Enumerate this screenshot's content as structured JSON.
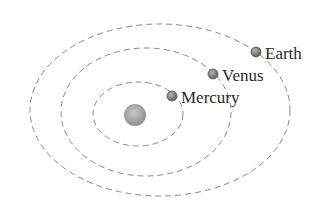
{
  "diagram": {
    "colors": {
      "orbit": "#8a8a8a",
      "planet_fill": "#8c8c8c",
      "planet_stroke": "#5a5a5a",
      "sun_fill": "#a8a8a8",
      "label": "#2a2a2a"
    },
    "sun": {
      "name": "Sun",
      "icon": "sun-circle"
    },
    "planets": [
      {
        "name": "Mercury",
        "label": "Mercury",
        "order": 1
      },
      {
        "name": "Venus",
        "label": "Venus",
        "order": 2
      },
      {
        "name": "Earth",
        "label": "Earth",
        "order": 3
      }
    ]
  }
}
